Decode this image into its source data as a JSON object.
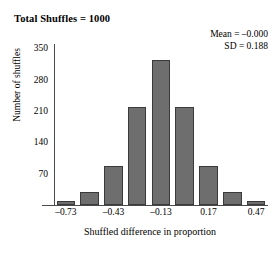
{
  "chart_data": {
    "type": "bar",
    "title": "Total Shuffles = 1000",
    "xlabel": "Shuffled difference in proportion",
    "ylabel": "Number of shuffles",
    "categories": [
      "-0.73",
      "-0.58",
      "-0.43",
      "-0.28",
      "-0.13",
      "0.02",
      "0.17",
      "0.32",
      "0.47"
    ],
    "values": [
      10,
      30,
      88,
      220,
      325,
      220,
      88,
      30,
      10
    ],
    "xlim": [
      -0.805,
      0.545
    ],
    "ylim": [
      0,
      360
    ],
    "x_tick_labels": [
      "–0.73",
      "–0.43",
      "–0.13",
      "0.17",
      "0.47"
    ],
    "x_tick_values": [
      -0.73,
      -0.43,
      -0.13,
      0.17,
      0.47
    ],
    "y_tick_labels": [
      "70",
      "140",
      "210",
      "280",
      "350"
    ],
    "y_tick_values": [
      70,
      140,
      210,
      280,
      350
    ],
    "grid": false,
    "legend": "none",
    "bar_color": "#6e6e6e",
    "bar_edge_color": "#3a3a3a",
    "annotations": {
      "mean_label": "Mean = –0.000",
      "sd_label": "SD = 0.188",
      "mean_value": -0.0,
      "sd_value": 0.188,
      "total_shuffles": 1000
    }
  }
}
